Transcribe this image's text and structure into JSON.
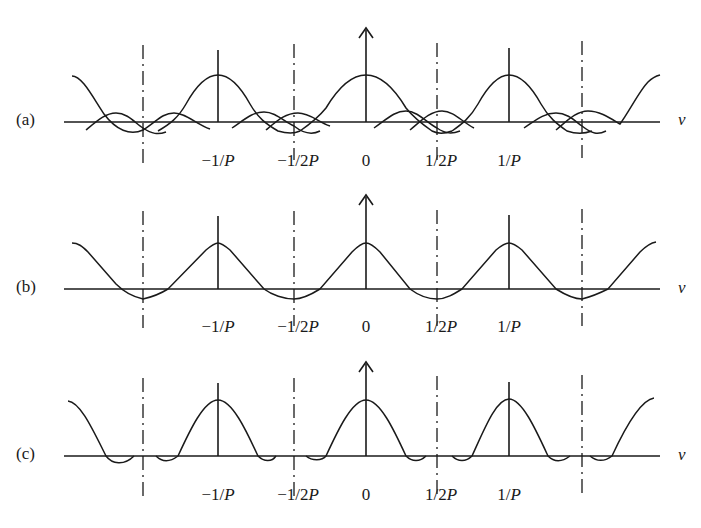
{
  "figure": {
    "panels": [
      {
        "id": "a",
        "label": "(a)",
        "axis_y": 122,
        "peak_y": 75,
        "arrow_top": 28,
        "stem_top": 50,
        "description": "Overlapping sinc-like lobes centered at n/P, side lobes crossing at ±1/2P"
      },
      {
        "id": "b",
        "label": "(b)",
        "axis_y": 289,
        "peak_y": 243,
        "arrow_top": 195,
        "stem_top": 215,
        "description": "Sum of lobes: triangular-like periodic waveform with minima at ±1/2P"
      },
      {
        "id": "c",
        "label": "(c)",
        "axis_y": 456,
        "peak_y": 400,
        "arrow_top": 362,
        "stem_top": 382,
        "description": "Periodic sinc-like peaks with small negative side lobes"
      }
    ],
    "x_axis_symbol": "ν",
    "tick_labels": [
      "−1/P",
      "−1/2P",
      "0",
      "1/2P",
      "1/P"
    ],
    "tick_positions_px": [
      218,
      294,
      366,
      437,
      509
    ],
    "dashdot_positions_px": [
      143,
      294,
      437,
      582
    ],
    "line_color": "#1a1a1a"
  },
  "ticks": {
    "m1P": {
      "pre": "−1/",
      "var": "P"
    },
    "m12P": {
      "pre": "−1/2",
      "var": "P"
    },
    "zero": {
      "pre": "0",
      "var": ""
    },
    "p12P": {
      "pre": "1/2",
      "var": "P"
    },
    "p1P": {
      "pre": "1/",
      "var": "P"
    }
  }
}
